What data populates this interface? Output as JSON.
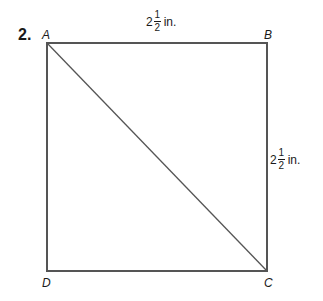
{
  "problem": {
    "number": "2.",
    "vertices": {
      "A": "A",
      "B": "B",
      "C": "C",
      "D": "D"
    },
    "top_side": {
      "whole": "2",
      "numerator": "1",
      "denominator": "2",
      "unit": "in."
    },
    "right_side": {
      "whole": "2",
      "numerator": "1",
      "denominator": "2",
      "unit": "in."
    },
    "shape": "square ABCD with diagonal AC",
    "colors": {
      "line": "#555555",
      "text": "#1a1a1a"
    }
  }
}
